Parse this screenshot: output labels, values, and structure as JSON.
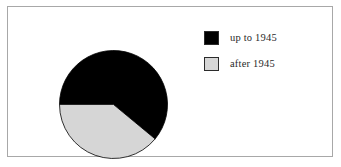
{
  "figure": {
    "background_color": "#ffffff",
    "frame_color": "#a8a8a8"
  },
  "legend": {
    "position": "right",
    "items": [
      {
        "label": "up to 1945",
        "color": "#000000",
        "swatch_name": "legend-swatch-black"
      },
      {
        "label": "after 1945",
        "color": "#d6d6d6",
        "swatch_name": "legend-swatch-gray"
      }
    ]
  },
  "chart_data": {
    "type": "pie",
    "title": "",
    "subtitle": "",
    "xlabel": "",
    "ylabel": "",
    "grid": false,
    "legend_position": "right",
    "categories": [
      "up to 1945",
      "after 1945"
    ],
    "values": [
      61,
      39
    ],
    "value_unit": "percent",
    "colors": [
      "#000000",
      "#d6d6d6"
    ],
    "edge_color": "#000000",
    "start_angle_deg": 180,
    "direction": "clockwise",
    "slices": [
      {
        "label": "up to 1945",
        "value": 61,
        "color": "#000000",
        "start_angle_deg": 180,
        "end_angle_deg": 400,
        "sweep_deg": 220
      },
      {
        "label": "after 1945",
        "value": 39,
        "color": "#d6d6d6",
        "start_angle_deg": 40,
        "end_angle_deg": 180,
        "sweep_deg": 140
      }
    ]
  }
}
